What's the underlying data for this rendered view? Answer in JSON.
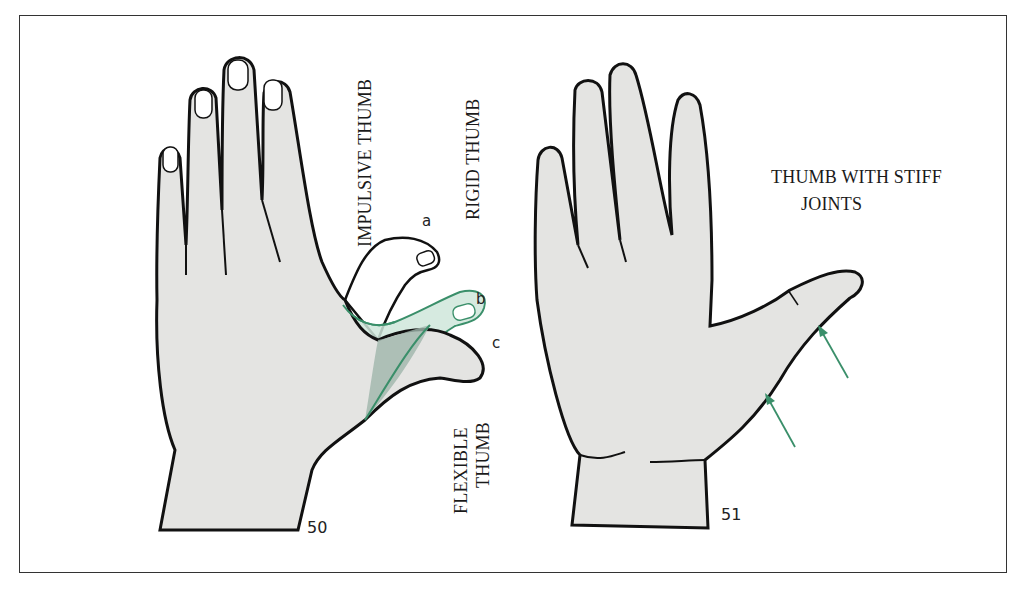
{
  "figure": {
    "left_hand": {
      "figure_number": "50",
      "labels": {
        "impulsive": "IMPULSIVE THUMB",
        "rigid": "RIGID THUMB",
        "flexible_line1": "FLEXIBLE",
        "flexible_line2": "THUMB"
      },
      "thumb_positions": {
        "a": "a",
        "b": "b",
        "c": "c"
      }
    },
    "right_hand": {
      "figure_number": "51",
      "labels": {
        "line1": "THUMB WITH STIFF",
        "line2": "JOINTS"
      }
    },
    "colors": {
      "skin_fill": "#e4e4e2",
      "outline": "#111111",
      "accent_green": "#3a8f6a",
      "green_fill": "#cfe6da",
      "green_dark_fill": "#9fb5ab",
      "frame": "#333333"
    }
  }
}
